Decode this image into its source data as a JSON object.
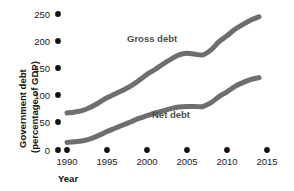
{
  "chart_data": {
    "type": "line",
    "title": "",
    "xlabel": "Year",
    "ylabel": "Government debt (percentage of GDP)",
    "ylabel_line1": "Government debt",
    "ylabel_line2": "(percentage of GDP)",
    "xlim": [
      1990,
      2015
    ],
    "ylim": [
      0,
      250
    ],
    "grid": false,
    "legend_position": "inline",
    "x_ticks": [
      "1990",
      "1995",
      "2000",
      "2005",
      "2010",
      "2015"
    ],
    "x_tick_values": [
      1990,
      1995,
      2000,
      2005,
      2010,
      2015
    ],
    "y_ticks": [
      "0",
      "50",
      "100",
      "150",
      "200",
      "250"
    ],
    "y_tick_values": [
      0,
      50,
      100,
      150,
      200,
      250
    ],
    "x": [
      1990,
      1991,
      1992,
      1993,
      1994,
      1995,
      1996,
      1997,
      1998,
      1999,
      2000,
      2001,
      2002,
      2003,
      2004,
      2005,
      2006,
      2007,
      2008,
      2009,
      2010,
      2011,
      2012,
      2013,
      2014
    ],
    "series": [
      {
        "name": "Gross debt",
        "label": "Gross debt",
        "color": "#6e6e6e",
        "values": [
          68,
          70,
          73,
          79,
          87,
          96,
          103,
          110,
          118,
          128,
          139,
          148,
          158,
          167,
          175,
          178,
          176,
          175,
          184,
          199,
          210,
          222,
          231,
          239,
          245
        ]
      },
      {
        "name": "Net debt",
        "label": "Net debt",
        "color": "#6e6e6e",
        "values": [
          14,
          15,
          17,
          21,
          27,
          34,
          40,
          46,
          52,
          58,
          63,
          68,
          72,
          76,
          79,
          80,
          80,
          80,
          87,
          98,
          107,
          117,
          124,
          130,
          133
        ]
      }
    ],
    "annotations": [
      {
        "text": "Gross debt",
        "x": 1999.2,
        "y": 196
      },
      {
        "text": "Net debt",
        "x": 2002.8,
        "y": 58
      }
    ],
    "colors": {
      "line": "#6e6e6e",
      "text": "#1a1a1a",
      "series_label": "#4d4d4d",
      "background": "#ffffff"
    }
  }
}
